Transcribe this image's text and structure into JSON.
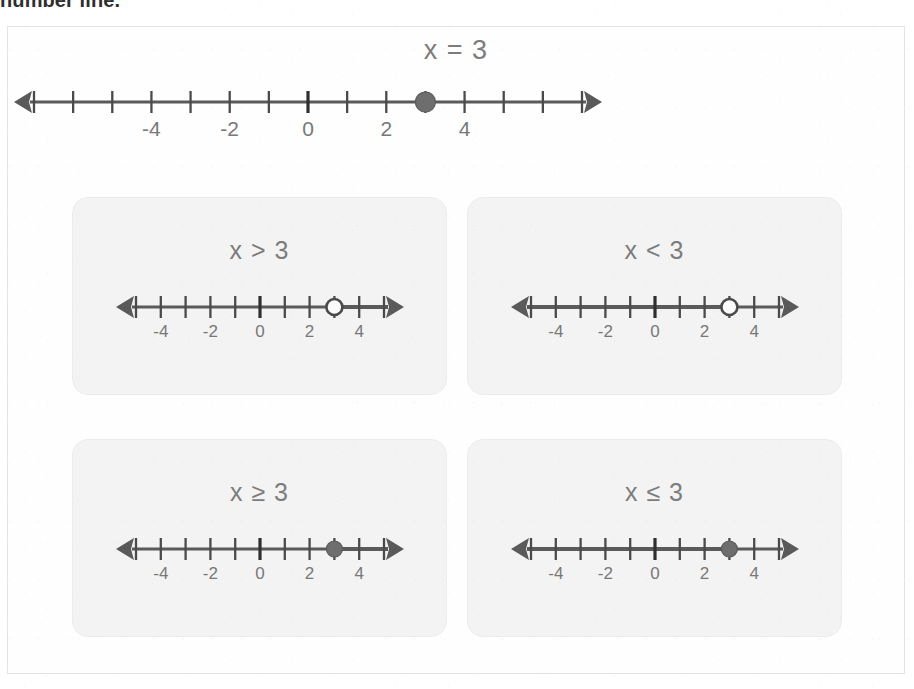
{
  "page": {
    "truncated_heading": "number line."
  },
  "colors": {
    "line": "#5a5a5a",
    "tick": "#4a4a4a",
    "zero_tick": "#2f2f2f",
    "label_text": "#787878",
    "filled_dot": "#6e6e6e",
    "open_dot_fill": "#fbfbfb",
    "card_bg": "#f3f3f3",
    "card_border": "#ececec",
    "frame_border": "#e3e3e3",
    "page_bg": "#ffffff"
  },
  "main": {
    "title": "x = 3",
    "number_line": {
      "min": -7,
      "max": 7,
      "labeled_ticks": [
        -4,
        -2,
        0,
        2,
        4
      ],
      "zero_tick": 0,
      "point": 3,
      "point_style": "filled",
      "ray": "none",
      "left_arrow": true,
      "right_arrow": true
    }
  },
  "cards": [
    {
      "title": "x > 3",
      "relation": "greater-than",
      "number_line": {
        "min": -5,
        "max": 5,
        "labeled_ticks": [
          -4,
          -2,
          0,
          2,
          4
        ],
        "zero_tick": 0,
        "point": 3,
        "point_style": "open",
        "ray": "right",
        "left_arrow": true,
        "right_arrow": true
      }
    },
    {
      "title": "x < 3",
      "relation": "less-than",
      "number_line": {
        "min": -5,
        "max": 5,
        "labeled_ticks": [
          -4,
          -2,
          0,
          2,
          4
        ],
        "zero_tick": 0,
        "point": 3,
        "point_style": "open",
        "ray": "left",
        "left_arrow": true,
        "right_arrow": true
      }
    },
    {
      "title": "x ≥ 3",
      "relation": "greater-or-equal",
      "number_line": {
        "min": -5,
        "max": 5,
        "labeled_ticks": [
          -4,
          -2,
          0,
          2,
          4
        ],
        "zero_tick": 0,
        "point": 3,
        "point_style": "filled",
        "ray": "right",
        "left_arrow": true,
        "right_arrow": true
      }
    },
    {
      "title": "x ≤ 3",
      "relation": "less-or-equal",
      "number_line": {
        "min": -5,
        "max": 5,
        "labeled_ticks": [
          -4,
          -2,
          0,
          2,
          4
        ],
        "zero_tick": 0,
        "point": 3,
        "point_style": "filled",
        "ray": "left",
        "left_arrow": true,
        "right_arrow": true
      }
    }
  ]
}
